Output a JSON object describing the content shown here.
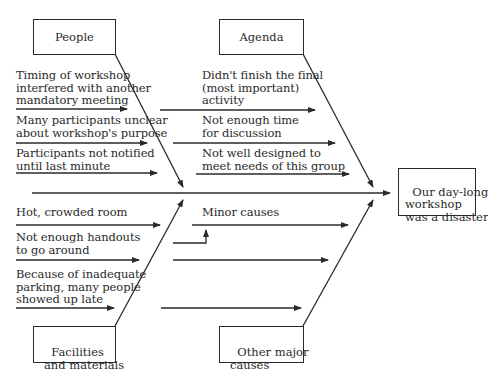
{
  "diagram": {
    "type": "fishbone",
    "effect": "Our day-long\nworkshop\nwas a disaster",
    "categories": {
      "people": {
        "label": "People",
        "causes": [
          "Timing of workshop\ninterfered with another\nmandatory meeting",
          "Many participants unclear\nabout workshop's purpose",
          "Participants not notified\nuntil last minute"
        ]
      },
      "agenda": {
        "label": "Agenda",
        "causes": [
          "Didn't finish the final\n(most important)\nactivity",
          "Not enough time\nfor discussion",
          "Not well designed to\nmeet needs of this group"
        ]
      },
      "facilities": {
        "label": "Facilities\nand materials",
        "causes": [
          "Hot, crowded room",
          "Not enough handouts\nto go around",
          "Because of inadequate\nparking, many people\nshowed up late"
        ]
      },
      "other": {
        "label": "Other major\ncauses",
        "annotation": "Minor causes"
      }
    },
    "colors": {
      "line": "#2a2a2a",
      "background": "#ffffff"
    }
  }
}
